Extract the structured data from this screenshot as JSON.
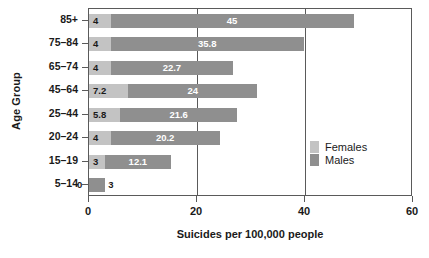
{
  "chart_data": {
    "type": "bar",
    "orientation": "horizontal",
    "stacked": true,
    "title": "",
    "xlabel": "Suicides per 100,000 people",
    "ylabel": "Age Group",
    "xlim": [
      0,
      60
    ],
    "xticks": [
      0,
      20,
      40,
      60
    ],
    "xtick_labels": [
      "0",
      "20",
      "40",
      "60"
    ],
    "grid": "vertical",
    "categories": [
      "85+",
      "75–84",
      "65–74",
      "45–64",
      "25–44",
      "20–24",
      "15–19",
      "5–14"
    ],
    "series": [
      {
        "name": "Females",
        "color": "#c3c3c3",
        "values": [
          4,
          4,
          4,
          7.2,
          5.8,
          4,
          3,
          0
        ],
        "labels": [
          "4",
          "4",
          "4",
          "7.2",
          "5.8",
          "4",
          "3",
          "0"
        ]
      },
      {
        "name": "Males",
        "color": "#8f8f8f",
        "values": [
          45,
          35.8,
          22.7,
          24,
          21.6,
          20.2,
          12.1,
          3
        ],
        "labels": [
          "45",
          "35.8",
          "22.7",
          "24",
          "21.6",
          "20.2",
          "12.1",
          "3"
        ]
      }
    ],
    "legend": {
      "position": "center-right",
      "entries": [
        {
          "label": "Females",
          "color": "#c3c3c3"
        },
        {
          "label": "Males",
          "color": "#8f8f8f"
        }
      ]
    }
  }
}
